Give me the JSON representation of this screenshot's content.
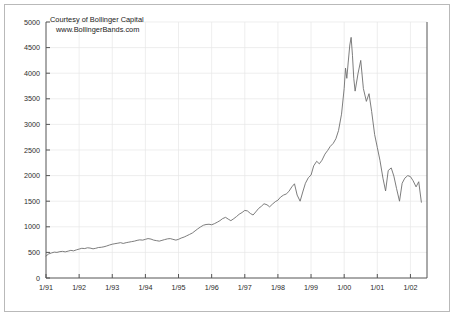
{
  "chart_data": {
    "type": "line",
    "title": "",
    "subtitle": "",
    "xlabel": "",
    "ylabel": "",
    "xlim": [
      1991.0,
      2002.5
    ],
    "ylim": [
      0,
      5000
    ],
    "grid": true,
    "legend_position": "none",
    "y_ticks": [
      0,
      500,
      1000,
      1500,
      2000,
      2500,
      3000,
      3500,
      4000,
      4500,
      5000
    ],
    "y_tick_labels": [
      "0",
      "500",
      "1000",
      "1500",
      "2000",
      "2500",
      "3000",
      "3500",
      "4000",
      "4500",
      "5000"
    ],
    "x_ticks": [
      1991,
      1992,
      1993,
      1994,
      1995,
      1996,
      1997,
      1998,
      1999,
      2000,
      2001,
      2002
    ],
    "x_tick_labels": [
      "1/91",
      "1/92",
      "1/93",
      "1/94",
      "1/95",
      "1/96",
      "1/97",
      "1/98",
      "1/99",
      "1/00",
      "1/01",
      "1/02"
    ],
    "annotations": [
      {
        "name": "credit-line-1",
        "text": "Courtesy of Bollinger Capital"
      },
      {
        "name": "credit-line-2",
        "text": "www.BollingerBands.com"
      }
    ],
    "series": [
      {
        "name": "index",
        "color": "#6e6e6e",
        "x": [
          1991.0,
          1991.08,
          1991.17,
          1991.25,
          1991.33,
          1991.42,
          1991.5,
          1991.58,
          1991.67,
          1991.75,
          1991.83,
          1991.92,
          1992.0,
          1992.08,
          1992.17,
          1992.25,
          1992.33,
          1992.42,
          1992.5,
          1992.58,
          1992.67,
          1992.75,
          1992.83,
          1992.92,
          1993.0,
          1993.08,
          1993.17,
          1993.25,
          1993.33,
          1993.42,
          1993.5,
          1993.58,
          1993.67,
          1993.75,
          1993.83,
          1993.92,
          1994.0,
          1994.08,
          1994.17,
          1994.25,
          1994.33,
          1994.42,
          1994.5,
          1994.58,
          1994.67,
          1994.75,
          1994.83,
          1994.92,
          1995.0,
          1995.08,
          1995.17,
          1995.25,
          1995.33,
          1995.42,
          1995.5,
          1995.58,
          1995.67,
          1995.75,
          1995.83,
          1995.92,
          1996.0,
          1996.08,
          1996.17,
          1996.25,
          1996.33,
          1996.42,
          1996.5,
          1996.58,
          1996.67,
          1996.75,
          1996.83,
          1996.92,
          1997.0,
          1997.08,
          1997.17,
          1997.25,
          1997.33,
          1997.42,
          1997.5,
          1997.58,
          1997.67,
          1997.75,
          1997.83,
          1997.92,
          1998.0,
          1998.08,
          1998.17,
          1998.25,
          1998.33,
          1998.42,
          1998.5,
          1998.58,
          1998.67,
          1998.75,
          1998.83,
          1998.92,
          1999.0,
          1999.08,
          1999.17,
          1999.25,
          1999.33,
          1999.42,
          1999.5,
          1999.58,
          1999.67,
          1999.75,
          1999.83,
          1999.92,
          2000.0,
          2000.04,
          2000.08,
          2000.12,
          2000.17,
          2000.21,
          2000.25,
          2000.29,
          2000.33,
          2000.42,
          2000.5,
          2000.58,
          2000.67,
          2000.75,
          2000.83,
          2000.92,
          2001.0,
          2001.08,
          2001.17,
          2001.25,
          2001.33,
          2001.42,
          2001.5,
          2001.58,
          2001.67,
          2001.75,
          2001.83,
          2001.92,
          2002.0,
          2002.08,
          2002.17,
          2002.25,
          2002.33
        ],
        "y": [
          430,
          470,
          490,
          505,
          500,
          515,
          520,
          510,
          525,
          540,
          530,
          550,
          565,
          580,
          575,
          590,
          585,
          570,
          580,
          595,
          600,
          610,
          625,
          645,
          660,
          670,
          680,
          690,
          675,
          690,
          700,
          710,
          720,
          735,
          745,
          740,
          755,
          770,
          760,
          740,
          730,
          720,
          735,
          750,
          765,
          770,
          755,
          740,
          755,
          780,
          800,
          825,
          850,
          880,
          920,
          960,
          1000,
          1030,
          1045,
          1050,
          1040,
          1060,
          1090,
          1120,
          1160,
          1185,
          1150,
          1120,
          1160,
          1200,
          1245,
          1280,
          1320,
          1310,
          1260,
          1230,
          1290,
          1360,
          1400,
          1450,
          1430,
          1390,
          1440,
          1490,
          1520,
          1580,
          1620,
          1640,
          1690,
          1780,
          1840,
          1620,
          1500,
          1680,
          1850,
          1960,
          2010,
          2190,
          2280,
          2230,
          2300,
          2420,
          2490,
          2570,
          2630,
          2720,
          2880,
          3200,
          3700,
          4100,
          3900,
          4200,
          4550,
          4700,
          4350,
          3900,
          3650,
          4000,
          4250,
          3700,
          3450,
          3600,
          3250,
          2800,
          2550,
          2300,
          1950,
          1700,
          2100,
          2150,
          1990,
          1750,
          1500,
          1850,
          1950,
          2000,
          1980,
          1900,
          1780,
          1880,
          1480
        ]
      }
    ]
  }
}
